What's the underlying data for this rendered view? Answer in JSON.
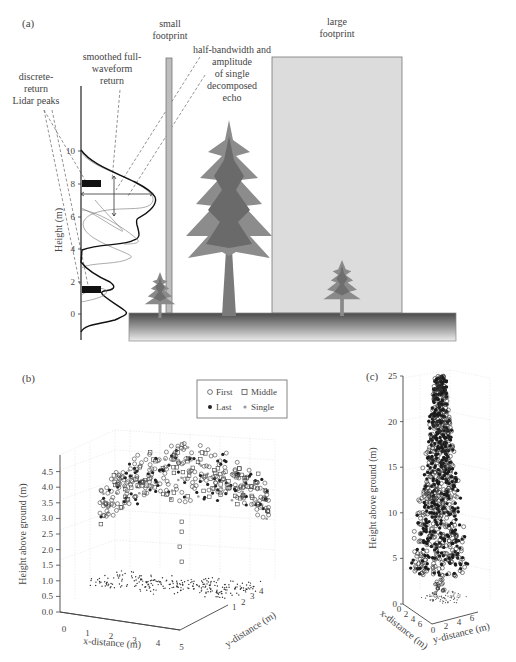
{
  "panel_a": {
    "label": "(a)",
    "annotations": {
      "discrete": [
        "discrete-",
        "return",
        "Lidar peaks"
      ],
      "smoothed": [
        "smoothed full-",
        "waveform",
        "return"
      ],
      "small_footprint": [
        "small",
        "footprint"
      ],
      "half_bandwidth": [
        "half-bandwidth and",
        "amplitude",
        "of single",
        "decomposed",
        "echo"
      ],
      "large_footprint": [
        "large",
        "footprint"
      ]
    },
    "y_axis": {
      "title": "Height (m)",
      "ticks": [
        "0",
        "2",
        "4",
        "6",
        "8",
        "10"
      ]
    },
    "discrete_peaks_m": [
      8.0,
      1.5
    ],
    "colors": {
      "tree": "#7a7a7a",
      "tree_dark": "#5e5e5e",
      "footprint_fill": "#d8d8d8",
      "ground_top": "#4a4a4a",
      "ground_bottom": "#e8e8e8"
    }
  },
  "panel_b": {
    "label": "(b)",
    "legend": [
      {
        "marker": "open-circle",
        "label": "First"
      },
      {
        "marker": "open-square",
        "label": "Middle"
      },
      {
        "marker": "filled-dot",
        "label": "Last"
      },
      {
        "marker": "gray-dot",
        "label": "Single"
      }
    ],
    "z_axis": {
      "title": "Height above ground (m)",
      "ticks": [
        "0.0",
        "0.5",
        "1.0",
        "1.5",
        "2.0",
        "2.5",
        "3.0",
        "3.5",
        "4.0",
        "4.5"
      ]
    },
    "x_axis": {
      "title": "x-distance (m)",
      "ticks": [
        "0",
        "1",
        "2",
        "3",
        "4",
        "5"
      ]
    },
    "y_axis": {
      "title": "y-distance (m)",
      "ticks": [
        "1",
        "2",
        "3",
        "4"
      ]
    }
  },
  "panel_c": {
    "label": "(c)",
    "z_axis": {
      "title": "Height above ground (m)",
      "ticks": [
        "0",
        "5",
        "10",
        "15",
        "20",
        "25"
      ]
    },
    "x_axis": {
      "title": "x-distance (m)",
      "ticks": [
        "0",
        "2",
        "4",
        "6"
      ]
    },
    "y_axis": {
      "title": "y-distance (m)",
      "ticks": [
        "0",
        "2",
        "4",
        "6"
      ]
    }
  }
}
